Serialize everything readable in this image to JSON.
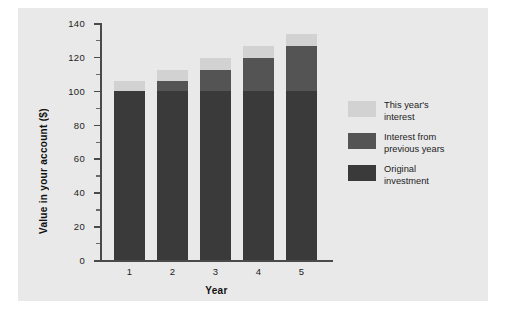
{
  "chart_data": {
    "type": "bar",
    "subtype": "stacked-bar",
    "title": "",
    "xlabel": "Year",
    "ylabel": "Value in your account ($)",
    "categories": [
      "1",
      "2",
      "3",
      "4",
      "5"
    ],
    "ylim": [
      0,
      140
    ],
    "ytick_labels": [
      "0",
      "20",
      "40",
      "60",
      "80",
      "100",
      "120",
      "140"
    ],
    "ytick_values": [
      0,
      20,
      40,
      60,
      80,
      100,
      120,
      140
    ],
    "ytick_minor_values": [
      10,
      30,
      50,
      70,
      90,
      110,
      130
    ],
    "grid": false,
    "legend_position": "right",
    "series": [
      {
        "name": "Original investment",
        "color": "#3a3a3a",
        "values": [
          100,
          100,
          100,
          100,
          100
        ]
      },
      {
        "name": "Interest from previous years",
        "color": "#545454",
        "values": [
          0,
          6,
          12.4,
          19.1,
          26.2
        ]
      },
      {
        "name": "This year's interest",
        "color": "#d2d2d2",
        "values": [
          6,
          6.4,
          6.7,
          7.1,
          7.6
        ]
      }
    ],
    "totals": [
      106,
      112.4,
      119.1,
      126.2,
      133.8
    ]
  },
  "legend": {
    "entries": [
      {
        "label": "This year's\ninterest",
        "color": "#d2d2d2"
      },
      {
        "label": "Interest from\nprevious years",
        "color": "#545454"
      },
      {
        "label": "Original\ninvestment",
        "color": "#3a3a3a"
      }
    ]
  },
  "axes": {
    "y_title": "Value in your account ($)",
    "x_title": "Year"
  },
  "colors": {
    "figure_background": "#e9e9e9",
    "page_background": "#ffffff",
    "axis": "#4a4a4a",
    "text": "#1d1d1d"
  }
}
